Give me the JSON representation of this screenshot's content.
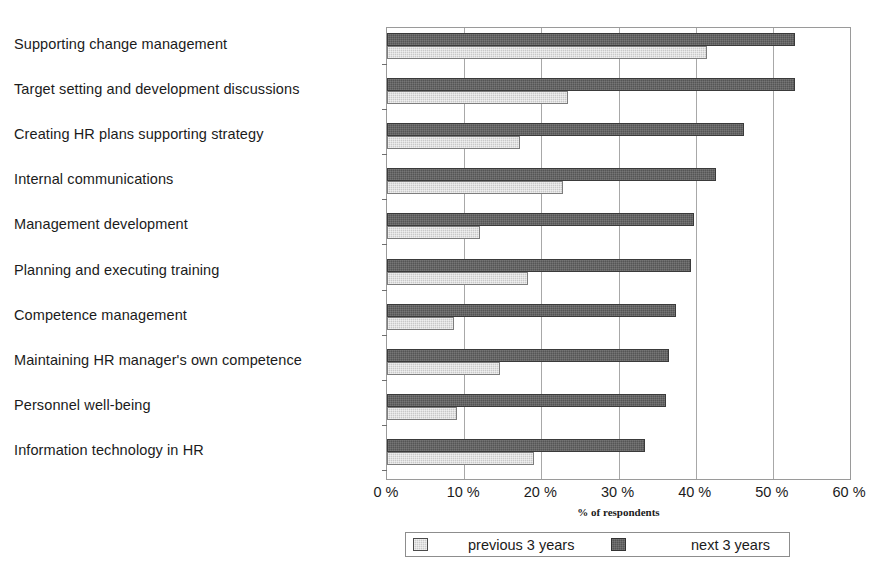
{
  "chart_data": {
    "type": "bar",
    "orientation": "horizontal",
    "title": "",
    "xlabel": "% of respondents",
    "ylabel": "",
    "xlim": [
      0,
      60
    ],
    "xticks": [
      0,
      10,
      20,
      30,
      40,
      50,
      60
    ],
    "xticklabels": [
      "0 %",
      "10 %",
      "20 %",
      "30 %",
      "40 %",
      "50 %",
      "60 %"
    ],
    "grid": "vertical",
    "legend_position": "bottom",
    "categories": [
      "Supporting change management",
      "Target setting and development discussions",
      "Creating HR plans supporting strategy",
      "Internal communications",
      "Management development",
      "Planning and executing training",
      "Competence management",
      "Maintaining HR manager's own competence",
      "Personnel well-being",
      "Information technology in HR"
    ],
    "series": [
      {
        "name": "previous 3 years",
        "color": "#c9c9c9",
        "values": [
          41.5,
          23.5,
          17.2,
          22.8,
          12.0,
          18.3,
          8.7,
          14.7,
          9.1,
          19.0
        ]
      },
      {
        "name": "next 3 years",
        "color": "#555555",
        "values": [
          52.9,
          52.9,
          46.2,
          42.6,
          39.8,
          39.4,
          37.4,
          36.6,
          36.1,
          33.4
        ]
      }
    ]
  },
  "legend": {
    "items": [
      {
        "label": "previous 3 years",
        "swatch": "light-gray-swatch"
      },
      {
        "label": "next 3 years",
        "swatch": "dark-gray-swatch"
      }
    ]
  }
}
